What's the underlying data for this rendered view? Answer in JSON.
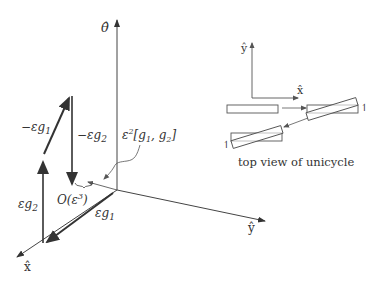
{
  "figure": {
    "main_axes": {
      "theta_label": "θ̂",
      "x_label": "x̂",
      "y_label": "ŷ"
    },
    "vectors": {
      "eps_g1": "εg",
      "eps_g1_sub": "1",
      "eps_g2": "εg",
      "eps_g2_sub": "2",
      "neg_eps_g1": "−εg",
      "neg_eps_g1_sub": "1",
      "neg_eps_g2": "−εg",
      "neg_eps_g2_sub": "2"
    },
    "annotations": {
      "bracket_prefix": "ε",
      "bracket_exp": "2",
      "bracket_body": "[g",
      "bracket_sub1": "1",
      "bracket_mid": ", g",
      "bracket_sub2": "2",
      "bracket_end": "]",
      "order_prefix": "O(ε",
      "order_exp": "3",
      "order_end": ")"
    },
    "inset": {
      "y_label": "ŷ",
      "x_label": "x̂",
      "caption": "top view of unicycle",
      "rotation_mark_1": "↿",
      "rotation_mark_2": "↿"
    },
    "colors": {
      "stroke": "#333333",
      "inset_stroke": "#555555"
    }
  }
}
